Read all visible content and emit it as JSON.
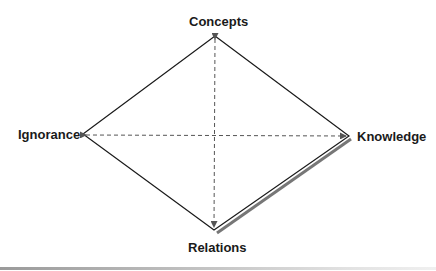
{
  "diagram": {
    "nodes": {
      "top": {
        "label": "Concepts"
      },
      "left": {
        "label": "Ignorance"
      },
      "right": {
        "label": "Knowledge"
      },
      "bottom": {
        "label": "Relations"
      }
    },
    "edges": [
      {
        "from": "Concepts",
        "to": "Knowledge",
        "style": "solid"
      },
      {
        "from": "Knowledge",
        "to": "Relations",
        "style": "solid-shadowed"
      },
      {
        "from": "Relations",
        "to": "Ignorance",
        "style": "solid"
      },
      {
        "from": "Ignorance",
        "to": "Concepts",
        "style": "solid"
      },
      {
        "from": "Ignorance",
        "to": "Knowledge",
        "style": "dashed-double-arrow"
      },
      {
        "from": "Concepts",
        "to": "Relations",
        "style": "dashed-double-arrow"
      }
    ],
    "colors": {
      "line": "#1a1a1a",
      "dashed": "#555555",
      "shadow": "#777777"
    }
  }
}
